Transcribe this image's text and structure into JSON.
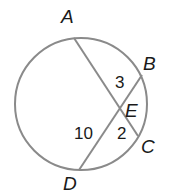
{
  "diagram": {
    "title": "",
    "circle": {
      "cx": 81,
      "cy": 104,
      "r": 66,
      "stroke": "#8a8a8a"
    },
    "chords": [
      {
        "name": "AC",
        "from": "A",
        "to": "C"
      },
      {
        "name": "BD",
        "from": "B",
        "to": "D"
      }
    ],
    "points": {
      "A": {
        "label": "A",
        "x": 74,
        "y": 38
      },
      "B": {
        "label": "B",
        "x": 142,
        "y": 75
      },
      "C": {
        "label": "C",
        "x": 138,
        "y": 136
      },
      "D": {
        "label": "D",
        "x": 79,
        "y": 170
      },
      "E": {
        "label": "E",
        "x": 118,
        "y": 110
      }
    },
    "segment_lengths": {
      "BE": "3",
      "DE": "10",
      "CE": "2"
    },
    "line_color": "#8a8a8a",
    "text_color": "#1a1a1a"
  }
}
